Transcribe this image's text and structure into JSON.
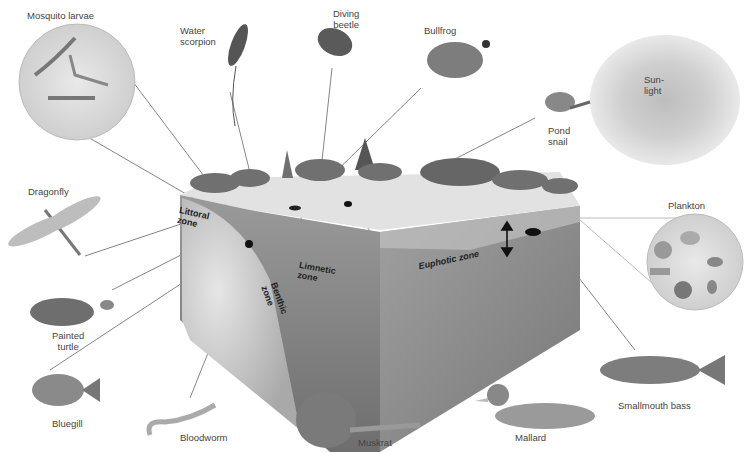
{
  "diagram": {
    "type": "lake ecosystem cross-section",
    "sun_label": "Sun-\nlight",
    "zones": {
      "littoral": "Littoral\nzone",
      "limnetic": "Limnetic\nzone",
      "benthic": "Benthic\nzone",
      "euphotic": "Euphotic zone"
    },
    "organisms": [
      {
        "id": "mosquito-larvae",
        "label": "Mosquito larvae"
      },
      {
        "id": "water-scorpion",
        "label": "Water\nscorpion"
      },
      {
        "id": "diving-beetle",
        "label": "Diving\nbeetle"
      },
      {
        "id": "bullfrog",
        "label": "Bullfrog"
      },
      {
        "id": "pond-snail",
        "label": "Pond\nsnail"
      },
      {
        "id": "dragonfly",
        "label": "Dragonfly"
      },
      {
        "id": "plankton",
        "label": "Plankton"
      },
      {
        "id": "painted-turtle",
        "label": "Painted\nturtle"
      },
      {
        "id": "bluegill",
        "label": "Bluegill"
      },
      {
        "id": "bloodworm",
        "label": "Bloodworm"
      },
      {
        "id": "muskrat",
        "label": "Muskrat"
      },
      {
        "id": "mallard",
        "label": "Mallard"
      },
      {
        "id": "smallmouth-bass",
        "label": "Smallmouth bass"
      }
    ],
    "colors": {
      "water_surface": "#d6d6d6",
      "water_body": "#8f8f8f",
      "sediment": "#c8c8c8",
      "vegetation": "#6a6a6a",
      "leader_line": "#555555"
    }
  }
}
